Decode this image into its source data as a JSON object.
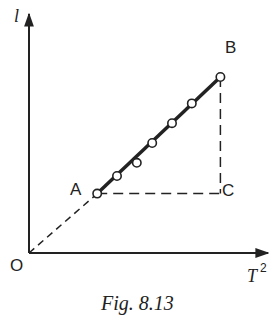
{
  "figure": {
    "caption": "Fig. 8.13",
    "y_axis_label": "l",
    "x_axis_label": "T",
    "x_axis_label_superscript": "2",
    "origin_label": "O",
    "point_labels": {
      "A": "A",
      "B": "B",
      "C": "C"
    },
    "colors": {
      "ink": "#222222",
      "background": "#ffffff"
    }
  },
  "chart_data": {
    "type": "scatter",
    "title": "",
    "xlabel": "T^2",
    "ylabel": "l",
    "points": [
      {
        "label": "A",
        "x": 0.31,
        "y": 0.27
      },
      {
        "label": "",
        "x": 0.4,
        "y": 0.35
      },
      {
        "label": "",
        "x": 0.49,
        "y": 0.41
      },
      {
        "label": "",
        "x": 0.56,
        "y": 0.5
      },
      {
        "label": "",
        "x": 0.65,
        "y": 0.59
      },
      {
        "label": "",
        "x": 0.74,
        "y": 0.68
      },
      {
        "label": "B",
        "x": 0.87,
        "y": 0.8
      }
    ],
    "best_fit_line": {
      "from": "A",
      "to": "B",
      "style": "solid-thick"
    },
    "extrapolation": {
      "from": "O",
      "to": "A",
      "style": "dashed"
    },
    "construction": [
      {
        "from": "A",
        "to": "C",
        "style": "dashed",
        "description": "horizontal"
      },
      {
        "from": "B",
        "to": "C",
        "style": "dashed",
        "description": "vertical"
      }
    ],
    "xlim": [
      0,
      1
    ],
    "ylim": [
      0,
      1
    ],
    "grid": false,
    "legend": "none"
  }
}
